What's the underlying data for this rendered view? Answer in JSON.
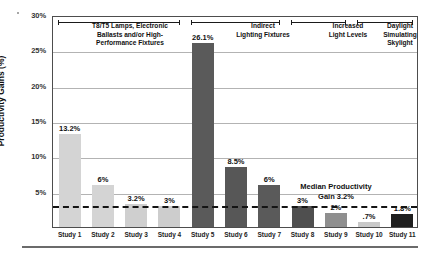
{
  "chart_data": {
    "type": "bar",
    "title": "",
    "xlabel": "",
    "ylabel": "Productivity Gains (%)",
    "ylim": [
      0,
      30
    ],
    "grid": true,
    "legend": "none",
    "categories": [
      "Study 1",
      "Study 2",
      "Study 3",
      "Study 4",
      "Study 5",
      "Study 6",
      "Study 7",
      "Study 8",
      "Study 9",
      "Study 10",
      "Study 11"
    ],
    "values": [
      13.2,
      6,
      3.2,
      3,
      26.1,
      8.5,
      6,
      3,
      2,
      0.7,
      1.8
    ],
    "value_labels": [
      "13.2%",
      "6%",
      "3.2%",
      "3%",
      "26.1%",
      "8.5%",
      "6%",
      "3%",
      "2%",
      ".7%",
      "1.8%"
    ],
    "bar_colors": [
      "#d4d4d4",
      "#d4d4d4",
      "#cfcfcf",
      "#cdcdcd",
      "#5a5a5a",
      "#575757",
      "#5a5a5a",
      "#4f4f4f",
      "#8f8f8f",
      "#c9c9c9",
      "#1f1f1f"
    ],
    "yticks": [
      "30%",
      "25%",
      "20%",
      "15%",
      "10%",
      "5%"
    ],
    "ytick_values": [
      30,
      25,
      20,
      15,
      10,
      5
    ],
    "reference_line": {
      "value": 3.2,
      "label_line1": "Median Productivity",
      "label_line2": "Gain 3.2%",
      "style": "dashed",
      "color": "#141414"
    },
    "annotations": [
      {
        "id": "cat-1",
        "label": "T8/T5 Lamps, Electronic Ballasts and/or High-Performance Fixtures",
        "spans": [
          "Study 1",
          "Study 2",
          "Study 3",
          "Study 4"
        ]
      },
      {
        "id": "cat-2",
        "label": "Indirect Lighting Fixtures",
        "spans": [
          "Study 5",
          "Study 6",
          "Study 7"
        ]
      },
      {
        "id": "cat-3",
        "label": "Increased Light Levels",
        "spans": [
          "Study 8",
          "Study 9"
        ]
      },
      {
        "id": "cat-4",
        "label": "Daylight Simulating Skylight",
        "spans": [
          "Study 10",
          "Study 11"
        ]
      }
    ]
  },
  "categories_text": {
    "cat1_line1": "T8/T5 Lamps, Electronic",
    "cat1_line2": "Ballasts and/or High-",
    "cat1_line3": "Performance Fixtures",
    "cat2_line1": "Indirect",
    "cat2_line2": "Lighting Fixtures",
    "cat3_line1": "Increased",
    "cat3_line2": "Light Levels",
    "cat4_line1": "Daylight",
    "cat4_line2": "Simulating",
    "cat4_line3": "Skylight"
  },
  "colors": {
    "frame": "#4d4d4d",
    "gridline": "#b3b3b3",
    "text": "#111111",
    "footer_rule": "#6b6b6b"
  }
}
